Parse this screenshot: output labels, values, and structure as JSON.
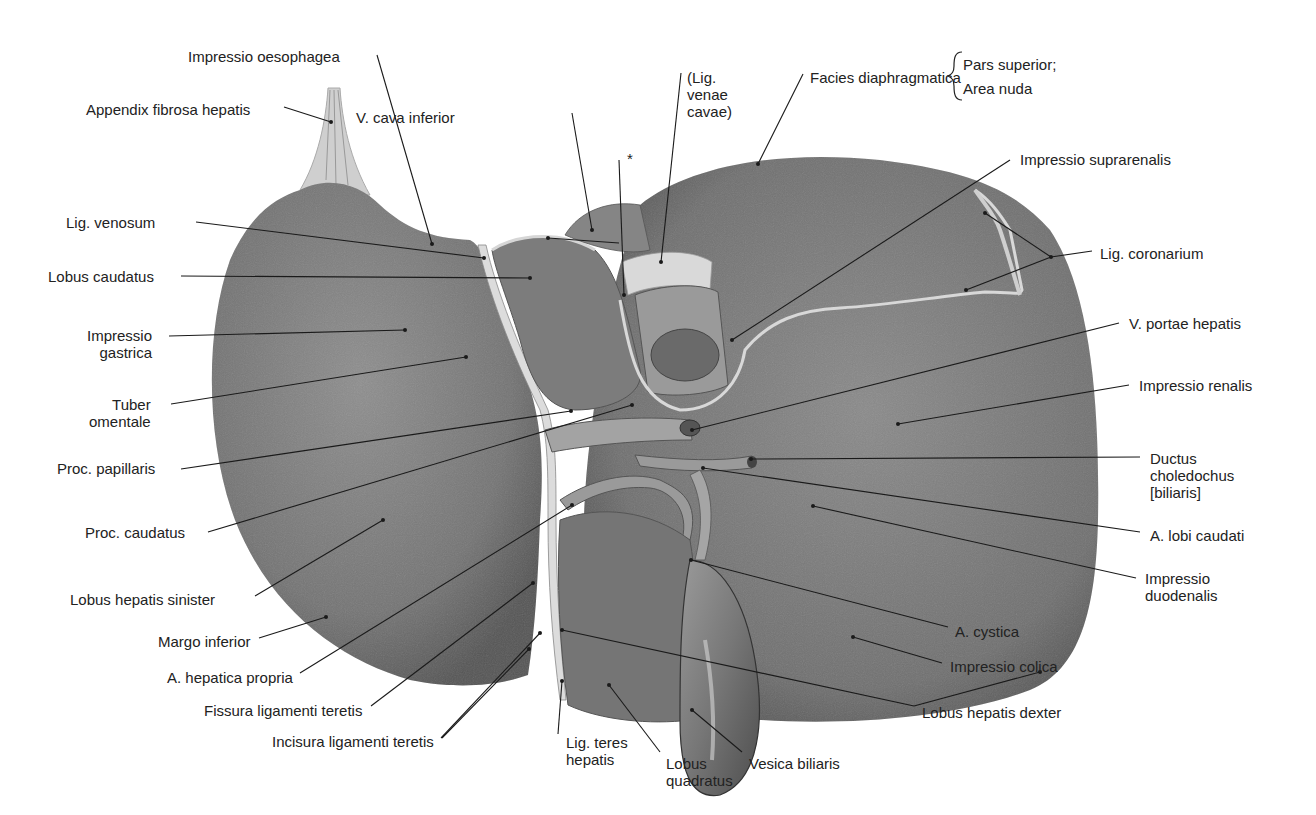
{
  "figure": {
    "colors": {
      "background": "#ffffff",
      "liver_dark": "#5e5e5e",
      "liver_mid": "#7a7a7a",
      "liver_light": "#8f8f8f",
      "ligament": "#d9d9d9",
      "vessel": "#9a9a9a",
      "leader": "#1a1a1a",
      "text": "#222222"
    }
  },
  "labels": [
    {
      "id": "impressio-oesophagea",
      "text": "Impressio oesophagea",
      "x": 188,
      "y": 48,
      "align": "l",
      "line": [
        [
          377,
          55
        ],
        [
          432,
          244
        ]
      ]
    },
    {
      "id": "appendix-fibrosa-hepatis",
      "text": "Appendix fibrosa hepatis",
      "x": 86,
      "y": 101,
      "align": "l",
      "line": [
        [
          284,
          107
        ],
        [
          331,
          122
        ]
      ]
    },
    {
      "id": "v-cava-inferior",
      "text": "V. cava inferior",
      "x": 356,
      "y": 109,
      "align": "l",
      "line": [
        [
          572,
          113
        ],
        [
          592,
          230
        ]
      ]
    },
    {
      "id": "asterisk",
      "text": "*",
      "x": 627,
      "y": 150,
      "align": "l",
      "line": [
        [
          619,
          160
        ],
        [
          624,
          295
        ]
      ]
    },
    {
      "id": "lig-venae-cavae",
      "text": "(Lig.\nvenae\ncavae)",
      "x": 687,
      "y": 69,
      "align": "l",
      "line": [
        [
          681,
          73
        ],
        [
          661,
          262
        ]
      ]
    },
    {
      "id": "facies-diaphragmatica",
      "text": "Facies diaphragmatica",
      "x": 810,
      "y": 69,
      "align": "l",
      "line": [
        [
          803,
          74
        ],
        [
          758,
          164
        ]
      ]
    },
    {
      "id": "pars-superior",
      "text": "Pars superior;",
      "x": 963,
      "y": 56,
      "align": "l"
    },
    {
      "id": "area-nuda",
      "text": "Area nuda",
      "x": 963,
      "y": 80,
      "align": "l"
    },
    {
      "id": "impressio-suprarenalis",
      "text": "Impressio suprarenalis",
      "x": 1020,
      "y": 151,
      "align": "l",
      "line": [
        [
          1010,
          160
        ],
        [
          732,
          340
        ]
      ]
    },
    {
      "id": "lig-coronarium",
      "text": "Lig. coronarium",
      "x": 1100,
      "y": 245,
      "align": "l",
      "line": [
        [
          1092,
          251
        ],
        [
          1051,
          257
        ]
      ]
    },
    {
      "id": "lig-venosum",
      "text": "Lig. venosum",
      "x": 66,
      "y": 214,
      "align": "l",
      "line": [
        [
          196,
          222
        ],
        [
          484,
          258
        ]
      ]
    },
    {
      "id": "lobus-caudatus",
      "text": "Lobus caudatus",
      "x": 48,
      "y": 268,
      "align": "l",
      "line": [
        [
          181,
          276
        ],
        [
          530,
          278
        ]
      ]
    },
    {
      "id": "impressio-gastrica",
      "text": "Impressio\ngastrica",
      "x": 87,
      "y": 327,
      "align": "r",
      "line": [
        [
          169,
          336
        ],
        [
          405,
          330
        ]
      ]
    },
    {
      "id": "tuber-omentale",
      "text": "Tuber\nomentale",
      "x": 89,
      "y": 396,
      "align": "r",
      "line": [
        [
          171,
          404
        ],
        [
          466,
          357
        ]
      ]
    },
    {
      "id": "proc-papillaris",
      "text": "Proc. papillaris",
      "x": 57,
      "y": 460,
      "align": "l",
      "line": [
        [
          181,
          469
        ],
        [
          571,
          411
        ]
      ]
    },
    {
      "id": "proc-caudatus",
      "text": "Proc. caudatus",
      "x": 85,
      "y": 524,
      "align": "l",
      "line": [
        [
          208,
          532
        ],
        [
          632,
          405
        ]
      ]
    },
    {
      "id": "lobus-hepatis-sinister",
      "text": "Lobus hepatis sinister",
      "x": 70,
      "y": 591,
      "align": "l",
      "line": [
        [
          255,
          596
        ],
        [
          383,
          520
        ]
      ]
    },
    {
      "id": "margo-inferior",
      "text": "Margo inferior",
      "x": 158,
      "y": 633,
      "align": "l",
      "line": [
        [
          259,
          638
        ],
        [
          326,
          617
        ]
      ]
    },
    {
      "id": "a-hepatica-propria",
      "text": "A. hepatica propria",
      "x": 167,
      "y": 669,
      "align": "l",
      "line": [
        [
          300,
          673
        ],
        [
          572,
          505
        ]
      ]
    },
    {
      "id": "fissura-ligamenti-teretis",
      "text": "Fissura ligamenti teretis",
      "x": 204,
      "y": 702,
      "align": "l",
      "line": [
        [
          371,
          706
        ],
        [
          533,
          583
        ]
      ]
    },
    {
      "id": "incisura-ligamenti-teretis",
      "text": "Incisura ligamenti teretis",
      "x": 272,
      "y": 733,
      "align": "l",
      "line": [
        [
          442,
          738
        ],
        [
          529,
          649
        ]
      ]
    },
    {
      "id": "lig-teres-hepatis",
      "text": "Lig. teres\nhepatis",
      "x": 566,
      "y": 734,
      "align": "l",
      "line": [
        [
          558,
          734
        ],
        [
          562,
          681
        ]
      ]
    },
    {
      "id": "lobus-quadratus",
      "text": "Lobus\nquadratus",
      "x": 666,
      "y": 755,
      "align": "l",
      "line": [
        [
          660,
          752
        ],
        [
          609,
          685
        ]
      ]
    },
    {
      "id": "vesica-biliaris",
      "text": "Vesica biliaris",
      "x": 749,
      "y": 755,
      "align": "l",
      "line": [
        [
          742,
          752
        ],
        [
          692,
          710
        ]
      ]
    },
    {
      "id": "lobus-hepatis-dexter",
      "text": "Lobus hepatis dexter",
      "x": 922,
      "y": 704,
      "align": "l",
      "line": [
        [
          914,
          706
        ],
        [
          562,
          630
        ]
      ]
    },
    {
      "id": "impressio-colica",
      "text": "Impressio colica",
      "x": 950,
      "y": 658,
      "align": "l",
      "line": [
        [
          942,
          663
        ],
        [
          853,
          637
        ]
      ]
    },
    {
      "id": "a-cystica",
      "text": "A. cystica",
      "x": 955,
      "y": 623,
      "align": "l",
      "line": [
        [
          948,
          627
        ],
        [
          691,
          560
        ]
      ]
    },
    {
      "id": "impressio-duodenalis",
      "text": "Impressio\nduodenalis",
      "x": 1145,
      "y": 570,
      "align": "l",
      "line": [
        [
          1136,
          578
        ],
        [
          813,
          506
        ]
      ]
    },
    {
      "id": "a-lobi-caudati",
      "text": "A. lobi caudati",
      "x": 1150,
      "y": 527,
      "align": "l",
      "line": [
        [
          1140,
          532
        ],
        [
          703,
          468
        ]
      ]
    },
    {
      "id": "ductus-choledochus",
      "text": "Ductus\ncholedochus\n[biliaris]",
      "x": 1150,
      "y": 450,
      "align": "l",
      "line": [
        [
          1140,
          457
        ],
        [
          751,
          459
        ]
      ]
    },
    {
      "id": "impressio-renalis",
      "text": "Impressio renalis",
      "x": 1139,
      "y": 377,
      "align": "l",
      "line": [
        [
          1129,
          385
        ],
        [
          898,
          424
        ]
      ]
    },
    {
      "id": "v-portae-hepatis",
      "text": "V. portae hepatis",
      "x": 1129,
      "y": 315,
      "align": "l",
      "line": [
        [
          1119,
          323
        ],
        [
          692,
          430
        ]
      ]
    }
  ],
  "extra_leaders": [
    [
      [
        619,
        243
      ],
      [
        548,
        238
      ]
    ],
    [
      [
        1051,
        257
      ],
      [
        985,
        213
      ]
    ],
    [
      [
        1051,
        257
      ],
      [
        966,
        290
      ]
    ],
    [
      [
        441,
        738
      ],
      [
        540,
        633
      ]
    ],
    [
      [
        914,
        706
      ],
      [
        1040,
        672
      ]
    ]
  ]
}
